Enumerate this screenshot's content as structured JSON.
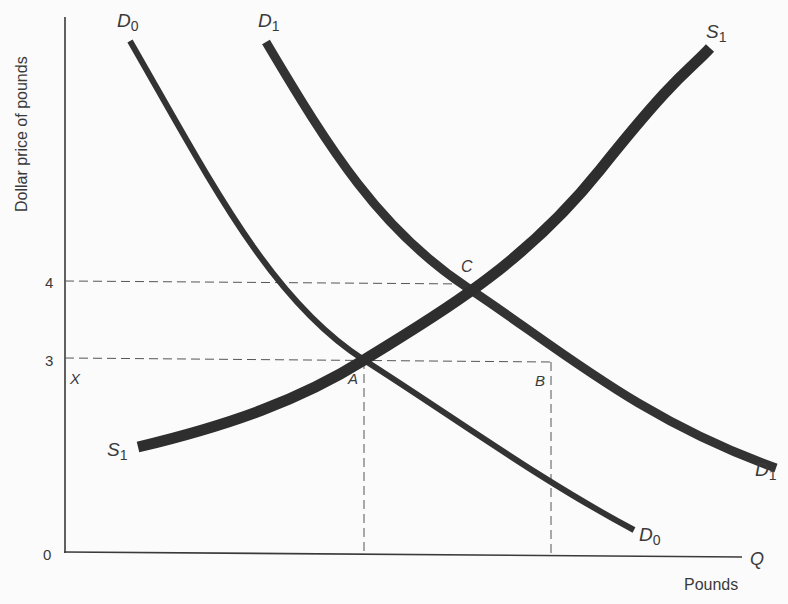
{
  "diagram": {
    "y_axis_label": "Dollar price of pounds",
    "x_axis_label": "Pounds",
    "x_axis_end_label": "Q",
    "origin_label": "0",
    "y_ticks": [
      "4",
      "3"
    ],
    "point_labels": {
      "X": "X",
      "A": "A",
      "B": "B",
      "C": "C"
    },
    "curves": {
      "D0": {
        "name": "D",
        "sub": "0"
      },
      "D1": {
        "name": "D",
        "sub": "1"
      },
      "S1": {
        "name": "S",
        "sub": "1"
      }
    },
    "colors": {
      "ink": "#333333",
      "axis": "#3a3a3a",
      "background": "#fbfbfb"
    }
  }
}
